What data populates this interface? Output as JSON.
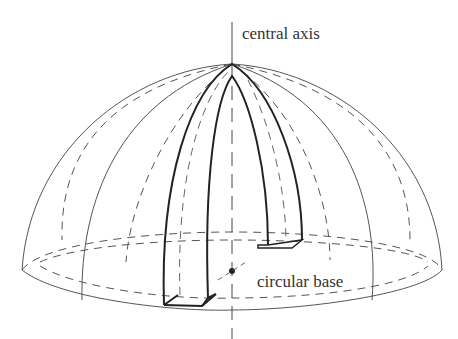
{
  "diagram": {
    "labels": {
      "axis": "central axis",
      "base": "circular base"
    },
    "elements": [
      "hemisphere dome (wireframe)",
      "arch segment",
      "central axis",
      "circular base",
      "center point"
    ],
    "colors": {
      "line": "#333333",
      "thin": "#666666"
    }
  }
}
